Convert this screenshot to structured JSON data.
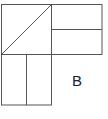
{
  "diagram": {
    "label": "B",
    "stroke_color": "#555555",
    "background": "#ffffff"
  }
}
